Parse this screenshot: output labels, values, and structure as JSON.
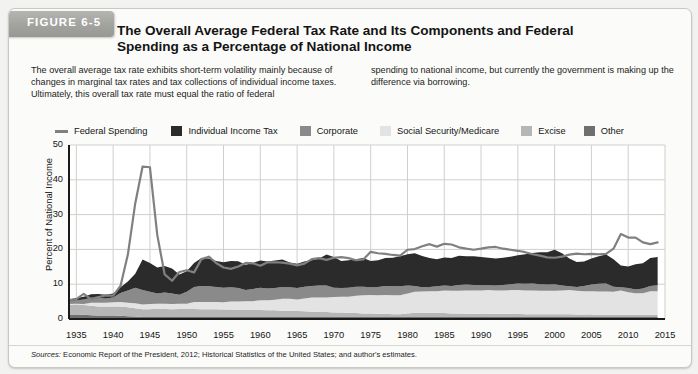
{
  "figure": {
    "tab_label": "FIGURE 6-5",
    "title": "The Overall Average Federal Tax Rate and Its Components and Federal Spending as a Percentage of National Income",
    "intro_left": "The overall average tax rate exhibits short-term volatility mainly because of changes in marginal tax rates and tax collections of individual income taxes. Ultimately, this overall tax rate must equal the ratio of federal",
    "intro_right": "spending to national income, but currently the government is making up the difference via borrowing.",
    "source_prefix": "Sources:",
    "source_text": " Economic Report of the President, 2012; Historical Statistics of the United States; and author's estimates."
  },
  "colors": {
    "federal_spending_line": "#808080",
    "individual_income_tax": "#2b2b2b",
    "corporate": "#8a8a8a",
    "social_security_medicare": "#e3e3e3",
    "excise": "#b6b6b6",
    "other": "#6f6f6f",
    "grid": "#cfcfcb",
    "axis": "#1a1a1a",
    "plot_bg": "#ffffff",
    "panel_bg": "#fbfbf9"
  },
  "chart_data": {
    "type": "area",
    "title": "The Overall Average Federal Tax Rate and Its Components and Federal Spending as a Percentage of National Income",
    "xlabel": "",
    "ylabel": "Percent of National Income",
    "xlim": [
      1934,
      2015
    ],
    "ylim": [
      0,
      50
    ],
    "yticks": [
      0,
      10,
      20,
      30,
      40,
      50
    ],
    "xticks": [
      1935,
      1940,
      1945,
      1950,
      1955,
      1960,
      1965,
      1970,
      1975,
      1980,
      1985,
      1990,
      1995,
      2000,
      2005,
      2010,
      2015
    ],
    "grid": true,
    "legend_position": "top",
    "stacked_order": [
      "Other",
      "Excise",
      "Social Security/Medicare",
      "Corporate",
      "Individual Income Tax"
    ],
    "legend": [
      {
        "label": "Federal Spending",
        "type": "line",
        "color": "#808080"
      },
      {
        "label": "Individual Income Tax",
        "type": "swatch",
        "color": "#2b2b2b"
      },
      {
        "label": "Corporate",
        "type": "swatch",
        "color": "#8a8a8a"
      },
      {
        "label": "Social Security/Medicare",
        "type": "swatch",
        "color": "#e3e3e3"
      },
      {
        "label": "Excise",
        "type": "swatch",
        "color": "#b6b6b6"
      },
      {
        "label": "Other",
        "type": "swatch",
        "color": "#6f6f6f"
      }
    ],
    "x": [
      1934,
      1935,
      1936,
      1937,
      1938,
      1939,
      1940,
      1941,
      1942,
      1943,
      1944,
      1945,
      1946,
      1947,
      1948,
      1949,
      1950,
      1951,
      1952,
      1953,
      1954,
      1955,
      1956,
      1957,
      1958,
      1959,
      1960,
      1961,
      1962,
      1963,
      1964,
      1965,
      1966,
      1967,
      1968,
      1969,
      1970,
      1971,
      1972,
      1973,
      1974,
      1975,
      1976,
      1977,
      1978,
      1979,
      1980,
      1981,
      1982,
      1983,
      1984,
      1985,
      1986,
      1987,
      1988,
      1989,
      1990,
      1991,
      1992,
      1993,
      1994,
      1995,
      1996,
      1997,
      1998,
      1999,
      2000,
      2001,
      2002,
      2003,
      2004,
      2005,
      2006,
      2007,
      2008,
      2009,
      2010,
      2011,
      2012,
      2013,
      2014
    ],
    "series": [
      {
        "name": "Other",
        "color": "#6f6f6f",
        "values": [
          1.3,
          1.3,
          1.2,
          1.1,
          1.0,
          1.0,
          1.0,
          0.9,
          0.8,
          0.7,
          0.6,
          0.6,
          0.6,
          0.6,
          0.6,
          0.6,
          0.6,
          0.6,
          0.6,
          0.6,
          0.6,
          0.6,
          0.6,
          0.6,
          0.6,
          0.6,
          0.6,
          0.6,
          0.6,
          0.6,
          0.6,
          0.6,
          0.6,
          0.6,
          0.6,
          0.6,
          0.6,
          0.6,
          0.6,
          0.6,
          0.6,
          0.6,
          0.6,
          0.6,
          0.6,
          0.6,
          0.6,
          0.6,
          0.6,
          0.6,
          0.6,
          0.6,
          0.6,
          0.6,
          0.6,
          0.6,
          0.6,
          0.6,
          0.6,
          0.6,
          0.6,
          0.6,
          0.6,
          0.6,
          0.6,
          0.6,
          0.6,
          0.6,
          0.6,
          0.6,
          0.6,
          0.6,
          0.6,
          0.6,
          0.6,
          0.6,
          0.6,
          0.6,
          0.6,
          0.6,
          0.6
        ]
      },
      {
        "name": "Excise",
        "color": "#b6b6b6",
        "values": [
          2.8,
          2.9,
          2.8,
          2.7,
          2.6,
          2.6,
          2.6,
          2.7,
          2.6,
          2.4,
          2.2,
          2.2,
          2.4,
          2.3,
          2.2,
          2.3,
          2.3,
          2.3,
          2.2,
          2.2,
          2.2,
          2.1,
          2.1,
          2.0,
          2.0,
          2.0,
          2.0,
          1.9,
          1.9,
          1.8,
          1.8,
          1.7,
          1.6,
          1.5,
          1.5,
          1.4,
          1.3,
          1.3,
          1.2,
          1.1,
          1.0,
          1.0,
          0.9,
          0.9,
          0.8,
          0.8,
          1.0,
          1.2,
          1.1,
          1.2,
          1.2,
          1.1,
          1.0,
          1.0,
          0.9,
          0.9,
          0.9,
          0.9,
          0.9,
          0.9,
          0.9,
          0.9,
          0.8,
          0.8,
          0.8,
          0.8,
          0.8,
          0.8,
          0.8,
          0.7,
          0.7,
          0.7,
          0.6,
          0.6,
          0.6,
          0.6,
          0.6,
          0.6,
          0.6,
          0.6,
          0.6
        ]
      },
      {
        "name": "Social Security/Medicare",
        "color": "#e3e3e3",
        "values": [
          0.2,
          0.2,
          0.3,
          0.9,
          1.1,
          1.1,
          1.2,
          1.3,
          1.3,
          1.4,
          1.4,
          1.5,
          1.4,
          1.5,
          1.5,
          1.5,
          1.5,
          2.0,
          2.1,
          2.1,
          2.1,
          2.1,
          2.3,
          2.4,
          2.5,
          2.5,
          2.8,
          2.9,
          3.0,
          3.4,
          3.4,
          3.3,
          3.7,
          4.1,
          4.1,
          4.2,
          4.4,
          4.5,
          4.6,
          5.0,
          5.2,
          5.3,
          5.3,
          5.4,
          5.4,
          5.4,
          5.7,
          6.0,
          6.2,
          6.2,
          6.2,
          6.5,
          6.5,
          6.5,
          6.7,
          6.7,
          6.7,
          6.8,
          6.7,
          6.7,
          6.8,
          6.8,
          6.8,
          6.8,
          6.7,
          6.7,
          6.7,
          6.8,
          6.9,
          6.8,
          6.7,
          6.7,
          6.7,
          6.7,
          6.6,
          7.0,
          6.5,
          6.2,
          6.2,
          6.8,
          6.8
        ]
      },
      {
        "name": "Corporate",
        "color": "#8a8a8a",
        "values": [
          0.8,
          1.0,
          1.3,
          1.4,
          1.3,
          1.2,
          1.4,
          2.6,
          3.5,
          4.5,
          4.1,
          3.5,
          2.9,
          3.2,
          3.0,
          2.6,
          3.4,
          4.3,
          4.6,
          4.5,
          4.3,
          4.2,
          4.1,
          3.9,
          3.2,
          3.5,
          3.6,
          3.4,
          3.4,
          3.4,
          3.3,
          3.3,
          3.4,
          3.3,
          3.4,
          3.4,
          2.7,
          2.5,
          2.6,
          2.6,
          2.5,
          2.2,
          2.4,
          2.6,
          2.6,
          2.6,
          2.3,
          1.7,
          1.2,
          1.2,
          1.4,
          1.4,
          1.4,
          1.7,
          1.7,
          1.6,
          1.5,
          1.4,
          1.4,
          1.6,
          1.7,
          1.9,
          1.9,
          2.0,
          1.9,
          1.8,
          1.9,
          1.4,
          1.1,
          1.1,
          1.5,
          1.9,
          2.2,
          2.3,
          1.5,
          0.9,
          1.2,
          1.1,
          1.4,
          1.5,
          1.7
        ]
      },
      {
        "name": "Individual Income Tax",
        "color": "#2b2b2b",
        "values": [
          0.5,
          0.6,
          0.8,
          1.0,
          1.2,
          1.1,
          1.1,
          1.6,
          2.6,
          4.0,
          8.8,
          8.3,
          7.5,
          7.6,
          7.2,
          5.8,
          5.9,
          6.9,
          8.0,
          8.0,
          7.5,
          7.3,
          7.6,
          7.7,
          7.3,
          7.5,
          7.8,
          7.7,
          7.9,
          7.9,
          7.1,
          7.0,
          7.2,
          7.4,
          7.8,
          8.9,
          8.8,
          7.8,
          7.9,
          7.9,
          8.2,
          7.6,
          7.7,
          8.0,
          8.2,
          8.6,
          9.0,
          9.4,
          9.0,
          8.3,
          7.8,
          8.1,
          8.0,
          8.4,
          8.1,
          8.2,
          8.1,
          7.9,
          7.8,
          7.8,
          7.9,
          8.1,
          8.5,
          8.8,
          9.2,
          9.3,
          9.9,
          9.3,
          8.0,
          7.2,
          7.0,
          7.5,
          7.9,
          8.3,
          7.9,
          6.3,
          6.2,
          7.2,
          7.2,
          8.0,
          8.1
        ]
      }
    ],
    "overlay_line": {
      "name": "Federal Spending",
      "color": "#808080",
      "values": [
        5.4,
        5.7,
        7.2,
        5.7,
        6.3,
        6.8,
        6.7,
        9.5,
        18.5,
        33.2,
        43.8,
        43.6,
        24.1,
        12.8,
        11.0,
        13.5,
        14.0,
        13.4,
        17.2,
        17.9,
        16.1,
        14.8,
        14.4,
        15.1,
        16.1,
        16.0,
        15.3,
        16.3,
        16.3,
        16.2,
        15.9,
        15.4,
        15.9,
        17.2,
        17.5,
        17.0,
        17.6,
        17.8,
        17.5,
        16.9,
        17.1,
        19.3,
        18.9,
        18.7,
        18.4,
        18.2,
        19.9,
        20.1,
        20.9,
        21.5,
        20.8,
        21.6,
        21.4,
        20.6,
        20.2,
        19.9,
        20.2,
        20.6,
        20.7,
        20.2,
        19.9,
        19.6,
        19.2,
        18.6,
        18.2,
        17.7,
        17.6,
        17.9,
        18.5,
        18.8,
        18.6,
        18.7,
        18.6,
        18.7,
        20.2,
        24.4,
        23.4,
        23.4,
        22.0,
        21.5,
        22.0
      ]
    }
  }
}
